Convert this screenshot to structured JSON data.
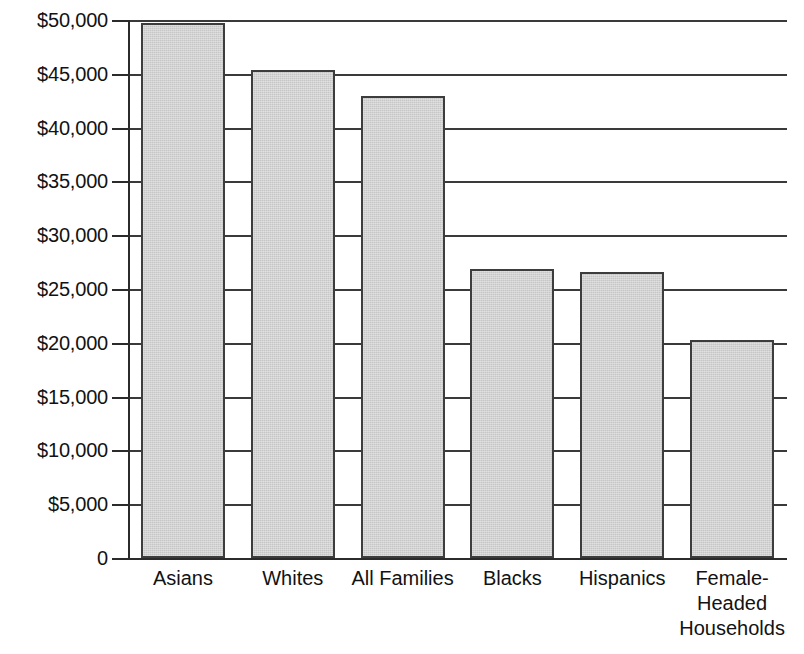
{
  "chart_data": {
    "type": "bar",
    "title": "",
    "xlabel": "",
    "ylabel": "",
    "ylim": [
      0,
      50000
    ],
    "grid": true,
    "legend": "none",
    "orientation": "vertical",
    "bar_color": "#c6c6c6",
    "bar_border_color": "#3d3d3d",
    "axis_color": "#2b2b2b",
    "categories": [
      "Asians",
      "Whites",
      "All Families",
      "Blacks",
      "Hispanics",
      "Female-Headed Households"
    ],
    "category_lines": [
      [
        "Asians"
      ],
      [
        "Whites"
      ],
      [
        "All Families"
      ],
      [
        "Blacks"
      ],
      [
        "Hispanics"
      ],
      [
        "Female-",
        "Headed",
        "Households"
      ]
    ],
    "values": [
      49700,
      45400,
      42900,
      26900,
      26600,
      20300
    ],
    "ytick_values": [
      50000,
      45000,
      40000,
      35000,
      30000,
      25000,
      20000,
      15000,
      10000,
      5000,
      0
    ],
    "ytick_labels": [
      "$50,000",
      "$45,000",
      "$40,000",
      "$35,000",
      "$30,000",
      "$25,000",
      "$20,000",
      "$15,000",
      "$10,000",
      "$5,000",
      "0"
    ]
  }
}
